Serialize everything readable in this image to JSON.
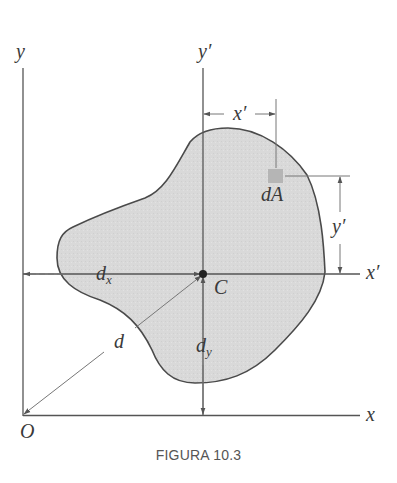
{
  "figure": {
    "caption": "FIGURA 10.3",
    "colors": {
      "region_fill": "#d9d9d9",
      "outline": "#4a4a4a",
      "axis": "#555555",
      "dimension_line": "#777777",
      "dA_fill": "#b5b5b5",
      "label": "#3a3a3a"
    },
    "labels": {
      "y_axis": "y",
      "x_axis": "x",
      "origin": "O",
      "y_prime_axis": "y′",
      "x_prime_axis": "x′",
      "x_prime_dim": "x′",
      "y_prime_dim": "y′",
      "dA": "dA",
      "centroid": "C",
      "d": "d",
      "dx_main": "d",
      "dx_sub": "x",
      "dy_main": "d",
      "dy_sub": "y"
    }
  }
}
